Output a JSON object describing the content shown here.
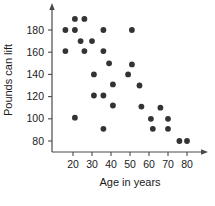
{
  "chart_data": {
    "type": "scatter",
    "title": "",
    "xlabel": "Age in years",
    "ylabel": "Pounds can lift",
    "xlim": [
      10,
      85
    ],
    "ylim": [
      70,
      195
    ],
    "xticks": [
      20,
      30,
      40,
      50,
      60,
      70,
      80
    ],
    "yticks": [
      80,
      100,
      120,
      140,
      160,
      180
    ],
    "grid": false,
    "legend": null,
    "point_color": "#333333",
    "axis_color": "#4a4a4a",
    "series": [
      {
        "name": "lifters",
        "points": [
          [
            16,
            180
          ],
          [
            16,
            161
          ],
          [
            21,
            180
          ],
          [
            21,
            190
          ],
          [
            21,
            101
          ],
          [
            24,
            170
          ],
          [
            26,
            190
          ],
          [
            26,
            161
          ],
          [
            30,
            170
          ],
          [
            31,
            140
          ],
          [
            31,
            121
          ],
          [
            36,
            180
          ],
          [
            36,
            161
          ],
          [
            36,
            121
          ],
          [
            36,
            91
          ],
          [
            39,
            150
          ],
          [
            41,
            131
          ],
          [
            41,
            112
          ],
          [
            49,
            140
          ],
          [
            51,
            180
          ],
          [
            51,
            149
          ],
          [
            55,
            130
          ],
          [
            56,
            111
          ],
          [
            61,
            100
          ],
          [
            62,
            91
          ],
          [
            66,
            110
          ],
          [
            70,
            100
          ],
          [
            70,
            91
          ],
          [
            76,
            80
          ],
          [
            80,
            80
          ]
        ]
      }
    ]
  }
}
